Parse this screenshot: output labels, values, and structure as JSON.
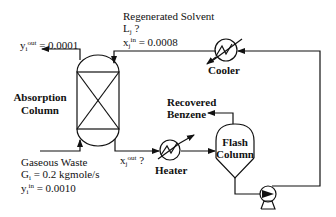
{
  "diagram": {
    "colors": {
      "stroke": "#111111",
      "background": "#ffffff"
    },
    "absorption_column": {
      "label_line1": "Absorption",
      "label_line2": "Column"
    },
    "flash_column": {
      "label_line1": "Flash",
      "label_line2": "Column"
    },
    "cooler": {
      "label": "Cooler"
    },
    "heater": {
      "label": "Heater"
    },
    "pump": {
      "icon": "pump-icon"
    },
    "gas_outlet": {
      "var": "y",
      "sub": "i",
      "sup": "out",
      "value": " = 0.0001"
    },
    "regenerated_solvent": {
      "title": "Regenerated Solvent",
      "flow_var": "L",
      "flow_sub": "j",
      "flow_value": " ?",
      "conc_var": "x",
      "conc_sub": "j",
      "conc_sup": "in",
      "conc_value": " = 0.0008"
    },
    "gaseous_waste": {
      "title": "Gaseous Waste",
      "flow_var": "G",
      "flow_sub": "i",
      "flow_value": " = 0.2 kgmole/s",
      "conc_var": "y",
      "conc_sub": "i",
      "conc_sup": "in",
      "conc_value": " = 0.0010"
    },
    "liquid_outlet": {
      "var": "x",
      "sub": "j",
      "sup": "out",
      "value": " ?"
    },
    "recovered_benzene": {
      "line1": "Recovered",
      "line2": "Benzene"
    }
  }
}
